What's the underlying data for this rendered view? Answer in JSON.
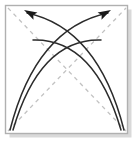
{
  "figure": {
    "kind": "origami-fold-diagram",
    "title": "Origami step: two curved fold arrows crossing over dashed diagonal creases",
    "canvas": {
      "width": 136,
      "height": 143
    },
    "background_color": "#ffffff"
  },
  "frame": {
    "label": "paper-square",
    "x": 5.5,
    "y": 5.5,
    "width": 122,
    "height": 128,
    "stroke_color": "#b0b0b0",
    "stroke_width": 1.4,
    "fill_color": "#ffffff",
    "shadow_color": "#d9d9d9",
    "shadow_offset_x": 4,
    "shadow_offset_y": 4
  },
  "creases": {
    "label": "dashed-diagonal-creases",
    "stroke_color": "#c2c2c2",
    "stroke_width": 1.3,
    "dash_pattern": "4 4",
    "lines": [
      {
        "name": "crease-tl-br",
        "x1": 8,
        "y1": 8,
        "x2": 126,
        "y2": 131
      },
      {
        "name": "crease-bl-tr",
        "x1": 8,
        "y1": 131,
        "x2": 126,
        "y2": 8
      }
    ]
  },
  "arrows": {
    "label": "curved-fold-arrows",
    "stroke_color": "#2b2b2b",
    "stroke_width": 1.5,
    "head_fill_color": "#1a1a1a",
    "items": [
      {
        "name": "arrow-bottom-left-to-top-right",
        "direction": "up-right",
        "has_head": true,
        "start": {
          "x": 10,
          "y": 130
        },
        "control": {
          "x": 36,
          "y": 28
        },
        "end": {
          "x": 108,
          "y": 13
        },
        "head_tip": {
          "x": 111,
          "y": 10
        },
        "head_angle_deg": -28
      },
      {
        "name": "arrow-bottom-right-to-top-left",
        "direction": "up-left",
        "has_head": true,
        "start": {
          "x": 124,
          "y": 130
        },
        "control": {
          "x": 98,
          "y": 28
        },
        "end": {
          "x": 27,
          "y": 13
        },
        "head_tip": {
          "x": 24,
          "y": 10
        },
        "head_angle_deg": 208
      },
      {
        "name": "arc-bottom-left-inner",
        "direction": "up-right",
        "has_head": false,
        "start": {
          "x": 13,
          "y": 130
        },
        "control": {
          "x": 40,
          "y": 38
        },
        "end": {
          "x": 101,
          "y": 40
        }
      },
      {
        "name": "arc-bottom-right-inner",
        "direction": "up-left",
        "has_head": false,
        "start": {
          "x": 121,
          "y": 130
        },
        "control": {
          "x": 94,
          "y": 38
        },
        "end": {
          "x": 33,
          "y": 40
        }
      }
    ]
  }
}
